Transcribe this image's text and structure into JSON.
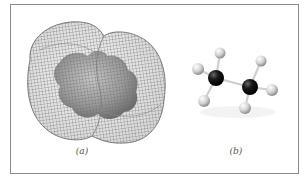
{
  "figure": {
    "panels": [
      {
        "id": "a",
        "label": "(a)",
        "depiction": "electron-density mesh surface over space-filling model"
      },
      {
        "id": "b",
        "label": "(b)",
        "depiction": "ball-and-stick model"
      }
    ],
    "colors": {
      "frame": "#8a8a8a",
      "mesh": "#6e6e6e",
      "surface": "#9a9a9a",
      "carbon": "#111111",
      "hydrogen": "#d8d8d8",
      "bond": "#cfcfcf"
    },
    "ball_and_stick": {
      "carbons": [
        {
          "x": 216,
          "y": 78,
          "r": 8
        },
        {
          "x": 250,
          "y": 87,
          "r": 8
        }
      ],
      "hydrogens": [
        {
          "x": 220,
          "y": 53,
          "r": 5.5
        },
        {
          "x": 198,
          "y": 69,
          "r": 6
        },
        {
          "x": 204,
          "y": 101,
          "r": 6
        },
        {
          "x": 261,
          "y": 61,
          "r": 5.5
        },
        {
          "x": 272,
          "y": 90,
          "r": 6
        },
        {
          "x": 245,
          "y": 108,
          "r": 6
        }
      ]
    }
  }
}
